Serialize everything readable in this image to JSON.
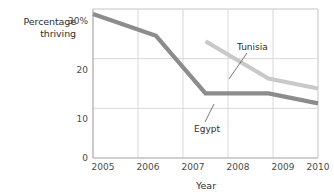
{
  "chart_data": {
    "type": "line",
    "title": "",
    "xlabel": "Year",
    "ylabel": "Percentage thriving",
    "ylabel_line1": "Percentage",
    "ylabel_line2": "thriving",
    "xlim": [
      2005,
      2010
    ],
    "ylim": [
      0,
      30
    ],
    "grid": true,
    "legend_position": "inline-annotations",
    "yticks": [
      "0",
      "10",
      "20",
      "30%"
    ],
    "ytick_values": [
      0,
      10,
      20,
      30
    ],
    "xticks": [
      "2005",
      "2006",
      "2007",
      "2008",
      "2009",
      "2010"
    ],
    "xtick_values": [
      2005,
      2006,
      2007,
      2008,
      2009,
      2010
    ],
    "series": [
      {
        "name": "Egypt",
        "color": "#8c8c8c",
        "x": [
          2005,
          2006.4,
          2007.5,
          2008.9,
          2010
        ],
        "values": [
          29,
          24.6,
          13,
          13,
          11
        ]
      },
      {
        "name": "Tunisia",
        "color": "#c9c9c9",
        "x": [
          2007.5,
          2008.9,
          2010
        ],
        "values": [
          23.5,
          16,
          14
        ]
      }
    ],
    "annotations": [
      {
        "label": "Tunisia",
        "label_x": 237,
        "label_y": 42,
        "leader_from_x": 247,
        "leader_from_y": 53,
        "leader_to_x": 229,
        "leader_to_y": 79
      },
      {
        "label": "Egypt",
        "label_x": 194,
        "label_y": 124,
        "leader_from_x": 205,
        "leader_from_y": 122,
        "leader_to_x": 214,
        "leader_to_y": 104
      }
    ]
  },
  "colors": {
    "grid": "#d8d8d8",
    "frame": "#c4c4c4",
    "text": "#3a3a3a",
    "egypt": "#8c8c8c",
    "tunisia": "#c9c9c9"
  },
  "plot_box": {
    "left": 93,
    "right": 318,
    "top": 9,
    "bottom": 158
  }
}
